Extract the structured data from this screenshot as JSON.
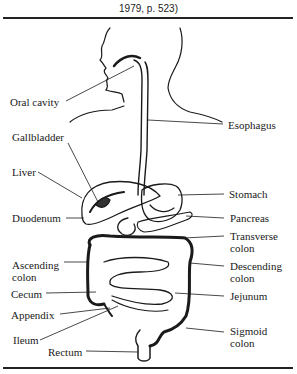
{
  "caption": "1979, p. 523)",
  "labels": {
    "oral_cavity": "Oral cavity",
    "gallbladder": "Gallbladder",
    "liver": "Liver",
    "duodenum": "Duodenum",
    "ascending_colon": "Ascending\ncolon",
    "cecum": "Cecum",
    "appendix": "Appendix",
    "ileum": "Ileum",
    "rectum": "Rectum",
    "esophagus": "Esophagus",
    "stomach": "Stomach",
    "pancreas": "Pancreas",
    "transverse_colon": "Transverse\ncolon",
    "descending_colon": "Descending\ncolon",
    "jejunum": "Jejunum",
    "sigmoid_colon": "Sigmoid\ncolon"
  }
}
